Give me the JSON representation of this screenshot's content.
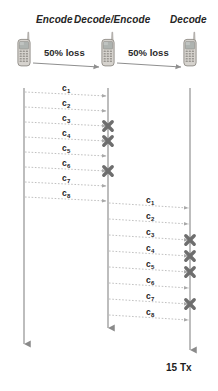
{
  "diagram": {
    "type": "sequence-diagram",
    "roles": [
      {
        "label": "Encode",
        "x": 36,
        "y": 14
      },
      {
        "label": "Decode/Encode",
        "x": 74,
        "y": 14
      },
      {
        "label": "Decode",
        "x": 170,
        "y": 14
      }
    ],
    "links": [
      {
        "label": "50% loss",
        "x": 44,
        "y": 47
      },
      {
        "label": "50% loss",
        "x": 128,
        "y": 47
      }
    ],
    "lifelines": [
      {
        "name": "encode-lifeline",
        "x": 24,
        "top": 88,
        "bottom": 344
      },
      {
        "name": "decode-encode-lifeline",
        "x": 108,
        "top": 88,
        "bottom": 328
      },
      {
        "name": "decode-lifeline",
        "x": 190,
        "top": 88,
        "bottom": 350
      }
    ],
    "nodes": [
      {
        "name": "phone-encode",
        "x": 24,
        "y": 62
      },
      {
        "name": "phone-decode-encode",
        "x": 108,
        "y": 62
      },
      {
        "name": "phone-decode",
        "x": 190,
        "y": 62
      }
    ],
    "hop1": {
      "from_x": 24,
      "to_x": 108,
      "label_x": 62,
      "messages": [
        {
          "label": "c",
          "index": "1",
          "y_start": 92,
          "y_end": 96,
          "lost": false
        },
        {
          "label": "c",
          "index": "2",
          "y_start": 107,
          "y_end": 111,
          "lost": false
        },
        {
          "label": "c",
          "index": "3",
          "y_start": 122,
          "y_end": 126,
          "lost": true
        },
        {
          "label": "c",
          "index": "4",
          "y_start": 137,
          "y_end": 141,
          "lost": true
        },
        {
          "label": "c",
          "index": "5",
          "y_start": 152,
          "y_end": 156,
          "lost": false
        },
        {
          "label": "c",
          "index": "6",
          "y_start": 167,
          "y_end": 171,
          "lost": true
        },
        {
          "label": "c",
          "index": "7",
          "y_start": 182,
          "y_end": 186,
          "lost": false
        },
        {
          "label": "c",
          "index": "8",
          "y_start": 197,
          "y_end": 201,
          "lost": false
        }
      ]
    },
    "hop2": {
      "from_x": 108,
      "to_x": 190,
      "label_x": 146,
      "messages": [
        {
          "label": "c",
          "index": "1",
          "y_start": 203,
          "y_end": 208,
          "lost": false
        },
        {
          "label": "c",
          "index": "2",
          "y_start": 219,
          "y_end": 224,
          "lost": false
        },
        {
          "label": "c",
          "index": "3",
          "y_start": 235,
          "y_end": 240,
          "lost": true
        },
        {
          "label": "c",
          "index": "4",
          "y_start": 251,
          "y_end": 256,
          "lost": true
        },
        {
          "label": "c",
          "index": "5",
          "y_start": 267,
          "y_end": 272,
          "lost": true
        },
        {
          "label": "c",
          "index": "6",
          "y_start": 283,
          "y_end": 288,
          "lost": false
        },
        {
          "label": "c",
          "index": "7",
          "y_start": 299,
          "y_end": 304,
          "lost": true
        },
        {
          "label": "c",
          "index": "8",
          "y_start": 315,
          "y_end": 320,
          "lost": false
        }
      ]
    },
    "footer": {
      "tx_count_label": "15 Tx",
      "x": 166,
      "y": 362
    },
    "colors": {
      "lifeline": "#9a9a9a",
      "message": "#b9b9b9",
      "loss_marker": "#6e6e6e",
      "hop_arrow": "#8f8f8f",
      "text": "#1d1d1d",
      "phone_body": "#d6d3ce",
      "phone_outline": "#8e8b86",
      "phone_screen": "#aeb3b0",
      "background": "#ffffff"
    }
  }
}
